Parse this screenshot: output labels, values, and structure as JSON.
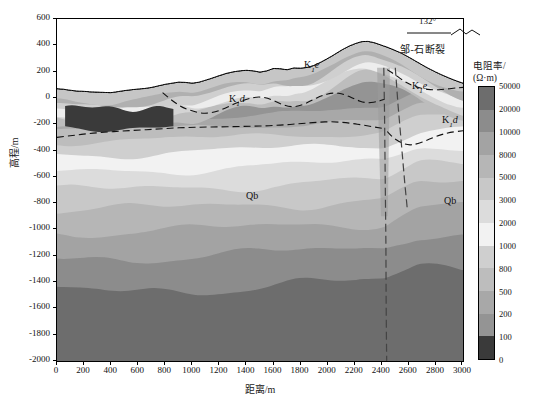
{
  "figure": {
    "type": "geoelectric-cross-section",
    "background": "#ffffff"
  },
  "axes": {
    "x": {
      "title": "距离/m",
      "min": 0,
      "max": 3000,
      "step": 200,
      "ticks": [
        0,
        200,
        400,
        600,
        800,
        1000,
        1200,
        1400,
        1600,
        1800,
        2000,
        2200,
        2400,
        2600,
        2800,
        3000
      ]
    },
    "y": {
      "title": "高程/m",
      "min": -2000,
      "max": 600,
      "step": 200,
      "ticks": [
        600,
        400,
        200,
        0,
        -200,
        -400,
        -600,
        -800,
        -1000,
        -1200,
        -1400,
        -1600,
        -1800,
        -2000
      ]
    }
  },
  "colorbar": {
    "title_line1": "电阻率/",
    "title_line2": "(Ω·m)",
    "unit": "Ω·m",
    "ticks": [
      50000,
      20000,
      10000,
      8000,
      5000,
      3000,
      2000,
      1000,
      800,
      500,
      200,
      100,
      0
    ],
    "colors": [
      "#6d6d6d",
      "#8c8c8c",
      "#a3a3a3",
      "#b6b6b6",
      "#c8c8c8",
      "#dcdcdc",
      "#f2f2f2",
      "#cfcfcf",
      "#bdbdbd",
      "#a8a8a8",
      "#949494",
      "#3a3a3a"
    ]
  },
  "annotations": {
    "strike_angle": "132°",
    "fault_name": "邹-石断裂"
  },
  "formation_labels": [
    {
      "id": "k1e-main",
      "base": "K",
      "sub": "1",
      "italic": "e",
      "x": 303,
      "y": 67
    },
    {
      "id": "k1d-main",
      "base": "K",
      "sub": "1",
      "italic": "d",
      "x": 228,
      "y": 101
    },
    {
      "id": "k1e-right",
      "base": "K",
      "sub": "1",
      "italic": "e",
      "x": 411,
      "y": 88
    },
    {
      "id": "k1d-right",
      "base": "K",
      "sub": "1",
      "italic": "d",
      "x": 441,
      "y": 122
    },
    {
      "id": "qb-left",
      "base": "Qb",
      "sub": "",
      "italic": "",
      "x": 245,
      "y": 198
    },
    {
      "id": "qb-right",
      "base": "Qb",
      "sub": "",
      "italic": "",
      "x": 443,
      "y": 203
    }
  ],
  "chart_data": {
    "type": "heatmap",
    "title": "",
    "xlabel": "距离/m",
    "ylabel": "高程/m",
    "xlim": [
      0,
      3000
    ],
    "ylim": [
      -2000,
      600
    ],
    "grid": false,
    "legend_position": "right",
    "value_label": "电阻率 (Ω·m)",
    "contour_levels": [
      0,
      100,
      200,
      500,
      800,
      1000,
      2000,
      3000,
      5000,
      8000,
      10000,
      20000,
      50000
    ],
    "topography": {
      "note": "ground surface elevation (m) sampled every 50 m of distance",
      "x": [
        0,
        50,
        100,
        150,
        200,
        250,
        300,
        350,
        400,
        450,
        500,
        550,
        600,
        650,
        700,
        750,
        800,
        850,
        900,
        950,
        1000,
        1050,
        1100,
        1150,
        1200,
        1250,
        1300,
        1350,
        1400,
        1450,
        1500,
        1550,
        1600,
        1650,
        1700,
        1750,
        1800,
        1850,
        1900,
        1950,
        2000,
        2050,
        2100,
        2150,
        2200,
        2250,
        2300,
        2350,
        2400,
        2450,
        2500,
        2550,
        2600,
        2650,
        2700,
        2750,
        2800,
        2850,
        2900,
        2950,
        3000
      ],
      "elevation": [
        70,
        66,
        58,
        52,
        50,
        46,
        44,
        42,
        40,
        48,
        56,
        62,
        68,
        72,
        80,
        92,
        104,
        112,
        120,
        118,
        112,
        120,
        136,
        152,
        170,
        186,
        198,
        206,
        210,
        206,
        196,
        206,
        224,
        222,
        214,
        228,
        226,
        232,
        248,
        272,
        300,
        330,
        362,
        390,
        412,
        428,
        430,
        418,
        400,
        382,
        360,
        338,
        310,
        280,
        250,
        222,
        196,
        172,
        150,
        130,
        112
      ]
    },
    "horizons": [
      {
        "name": "K1e-K1d boundary (west block)",
        "style": "dashed",
        "x": [
          780,
          850,
          920,
          1000,
          1080,
          1160,
          1240,
          1320,
          1400,
          1480,
          1560,
          1640,
          1720,
          1800,
          1880,
          1960,
          2040,
          2120,
          2200,
          2280,
          2360,
          2420
        ],
        "y": [
          40,
          -20,
          -70,
          -100,
          -120,
          -110,
          -80,
          -40,
          -10,
          10,
          0,
          -40,
          -70,
          -60,
          -20,
          20,
          40,
          30,
          -10,
          -40,
          -30,
          -10
        ]
      },
      {
        "name": "K1d-Qb boundary (west block)",
        "style": "dashed",
        "x": [
          0,
          120,
          240,
          360,
          480,
          600,
          720,
          840,
          960,
          1080,
          1200,
          1320,
          1440,
          1560,
          1680,
          1800,
          1920,
          2040,
          2160,
          2280,
          2400
        ],
        "y": [
          -300,
          -285,
          -270,
          -260,
          -252,
          -245,
          -238,
          -230,
          -225,
          -222,
          -220,
          -218,
          -215,
          -212,
          -205,
          -195,
          -185,
          -180,
          -190,
          -210,
          -230
        ]
      },
      {
        "name": "K1e-K1d boundary (east block)",
        "style": "dashed",
        "x": [
          2440,
          2500,
          2560,
          2620,
          2700,
          2780,
          2860,
          2940,
          3000
        ],
        "y": [
          215,
          175,
          130,
          95,
          70,
          60,
          65,
          75,
          80
        ]
      },
      {
        "name": "K1d-Qb boundary (east block)",
        "style": "dashed",
        "x": [
          2440,
          2480,
          2540,
          2600,
          2660,
          2740,
          2820,
          2900,
          3000
        ],
        "y": [
          -255,
          -300,
          -340,
          -360,
          -350,
          -320,
          -285,
          -262,
          -250
        ]
      }
    ],
    "faults": [
      {
        "name": "邹-石断裂 main fault",
        "style": "dashed",
        "x": [
          2415,
          2420,
          2425,
          2430,
          2432,
          2434,
          2436
        ],
        "y": [
          230,
          -100,
          -600,
          -1100,
          -1500,
          -1800,
          -2000
        ]
      },
      {
        "name": "secondary branch fault",
        "style": "dashed",
        "x": [
          2500,
          2520,
          2545,
          2570,
          2590
        ],
        "y": [
          230,
          -50,
          -350,
          -650,
          -860
        ]
      }
    ],
    "anomaly": {
      "name": "low-resistivity body (<100 Ω·m)",
      "value_range": [
        0,
        100
      ],
      "x_extent": [
        60,
        860
      ],
      "y_extent": [
        -215,
        -75
      ]
    },
    "bands": [
      {
        "level": "50000",
        "color": "#6d6d6d",
        "note": "deepest high-resistivity basement"
      },
      {
        "level": "20000",
        "color": "#8c8c8c"
      },
      {
        "level": "10000",
        "color": "#a3a3a3"
      },
      {
        "level": "8000",
        "color": "#b6b6b6"
      },
      {
        "level": "5000",
        "color": "#c8c8c8"
      },
      {
        "level": "3000",
        "color": "#dcdcdc"
      },
      {
        "level": "2000",
        "color": "#f2f2f2",
        "note": "lightest band"
      },
      {
        "level": "1000",
        "color": "#cfcfcf"
      },
      {
        "level": "800",
        "color": "#bdbdbd"
      },
      {
        "level": "500",
        "color": "#a8a8a8"
      },
      {
        "level": "200",
        "color": "#949494"
      },
      {
        "level": "100",
        "color": "#3a3a3a",
        "note": "dark low-resistivity anomaly"
      }
    ]
  }
}
